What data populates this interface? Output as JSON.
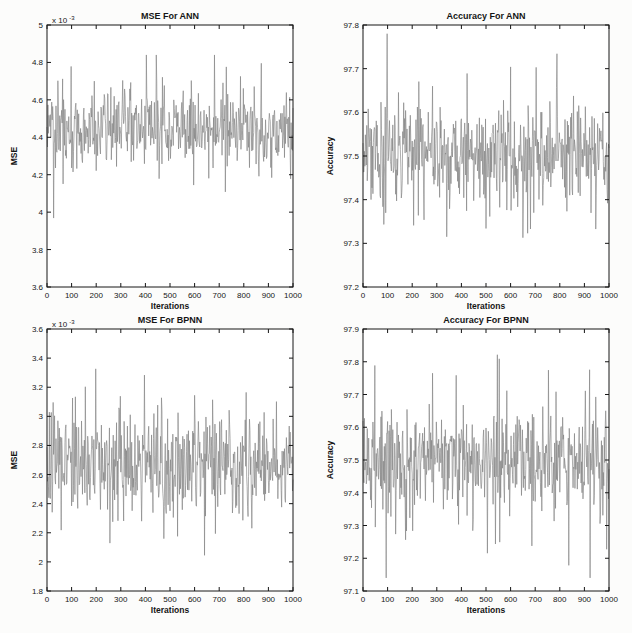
{
  "page": {
    "background": "#fcfcfb",
    "plot_background": "#ffffff",
    "axis_color": "#161616",
    "line_color": "#828282"
  },
  "chart_data": [
    {
      "id": "mse-ann",
      "type": "line",
      "title": "MSE For ANN",
      "xlabel": "Iterations",
      "ylabel": "MSE",
      "exponent_label": {
        "base": "x 10",
        "sup": "-3"
      },
      "legend": null,
      "grid": false,
      "xlim": [
        0,
        1000
      ],
      "ylim": [
        3.6,
        5.0
      ],
      "x_tick_values": [
        0,
        100,
        200,
        300,
        400,
        500,
        600,
        700,
        800,
        900,
        1000
      ],
      "x_tick_labels": [
        "0",
        "100",
        "200",
        "300",
        "400",
        "500",
        "600",
        "700",
        "800",
        "900",
        "1000"
      ],
      "y_tick_values": [
        3.6,
        3.8,
        4.0,
        4.2,
        4.4,
        4.6,
        4.8,
        5.0
      ],
      "y_tick_labels": [
        "3.6",
        "3.8",
        "4",
        "4.2",
        "4.4",
        "4.6",
        "4.8",
        "5"
      ],
      "series_spec": {
        "note": "random noise trace, y values in units of 1e-3",
        "n_iterations": 1000,
        "mean": 4.45,
        "sigma_core": 0.095,
        "sigma_tail": 0.21,
        "tail_prob": 0.17,
        "observed_min": 3.77,
        "observed_max": 4.84,
        "seed": 101
      }
    },
    {
      "id": "accuracy-ann",
      "type": "line",
      "title": "Accuracy For ANN",
      "xlabel": "Iterations",
      "ylabel": "Accuracy",
      "exponent_label": null,
      "legend": null,
      "grid": false,
      "xlim": [
        0,
        1000
      ],
      "ylim": [
        97.2,
        97.8
      ],
      "x_tick_values": [
        0,
        100,
        200,
        300,
        400,
        500,
        600,
        700,
        800,
        900,
        1000
      ],
      "x_tick_labels": [
        "0",
        "100",
        "200",
        "300",
        "400",
        "500",
        "600",
        "700",
        "800",
        "900",
        "1000"
      ],
      "y_tick_values": [
        97.2,
        97.3,
        97.4,
        97.5,
        97.6,
        97.7,
        97.8
      ],
      "y_tick_labels": [
        "97.2",
        "97.3",
        "97.4",
        "97.5",
        "97.6",
        "97.7",
        "97.8"
      ],
      "series_spec": {
        "note": "random noise trace, accuracy in percent",
        "n_iterations": 1000,
        "mean": 97.503,
        "sigma_core": 0.052,
        "sigma_tail": 0.115,
        "tail_prob": 0.18,
        "observed_min": 97.27,
        "observed_max": 97.78,
        "seed": 202
      }
    },
    {
      "id": "mse-bpnn",
      "type": "line",
      "title": "MSE For BPNN",
      "xlabel": "Iterations",
      "ylabel": "MSE",
      "exponent_label": {
        "base": "x 10",
        "sup": "-3"
      },
      "legend": null,
      "grid": false,
      "xlim": [
        0,
        1000
      ],
      "ylim": [
        1.8,
        3.6
      ],
      "x_tick_values": [
        0,
        100,
        200,
        300,
        400,
        500,
        600,
        700,
        800,
        900,
        1000
      ],
      "x_tick_labels": [
        "0",
        "100",
        "200",
        "300",
        "400",
        "500",
        "600",
        "700",
        "800",
        "900",
        "1000"
      ],
      "y_tick_values": [
        1.8,
        2.0,
        2.2,
        2.4,
        2.6,
        2.8,
        3.0,
        3.2,
        3.4,
        3.6
      ],
      "y_tick_labels": [
        "1.8",
        "2",
        "2.2",
        "2.4",
        "2.6",
        "2.8",
        "3",
        "3.2",
        "3.4",
        "3.6"
      ],
      "series_spec": {
        "note": "random noise trace, y values in units of 1e-3",
        "n_iterations": 1000,
        "mean": 2.67,
        "sigma_core": 0.155,
        "sigma_tail": 0.32,
        "tail_prob": 0.17,
        "observed_min": 1.96,
        "observed_max": 3.45,
        "seed": 303
      }
    },
    {
      "id": "accuracy-bpnn",
      "type": "line",
      "title": "Accuracy For BPNN",
      "xlabel": "Iterations",
      "ylabel": "Accuracy",
      "exponent_label": null,
      "legend": null,
      "grid": false,
      "xlim": [
        0,
        1000
      ],
      "ylim": [
        97.1,
        97.9
      ],
      "x_tick_values": [
        0,
        100,
        200,
        300,
        400,
        500,
        600,
        700,
        800,
        900,
        1000
      ],
      "x_tick_labels": [
        "0",
        "100",
        "200",
        "300",
        "400",
        "500",
        "600",
        "700",
        "800",
        "900",
        "1000"
      ],
      "y_tick_values": [
        97.1,
        97.2,
        97.3,
        97.4,
        97.5,
        97.6,
        97.7,
        97.8,
        97.9
      ],
      "y_tick_labels": [
        "97.1",
        "97.2",
        "97.3",
        "97.4",
        "97.5",
        "97.6",
        "97.7",
        "97.8",
        "97.9"
      ],
      "series_spec": {
        "note": "random noise trace, accuracy in percent",
        "n_iterations": 1000,
        "mean": 97.5,
        "sigma_core": 0.075,
        "sigma_tail": 0.16,
        "tail_prob": 0.18,
        "observed_min": 97.14,
        "observed_max": 97.86,
        "seed": 404
      }
    }
  ]
}
